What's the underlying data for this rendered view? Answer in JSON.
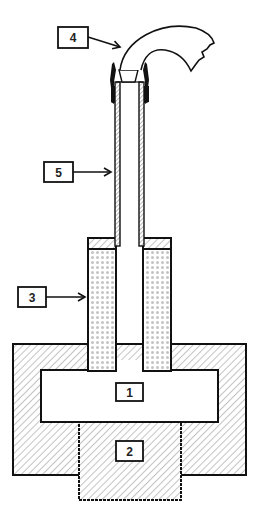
{
  "diagram": {
    "type": "cross-section schematic",
    "colors": {
      "stroke": "#111111",
      "hatch": "#9a9a9a",
      "dots": "#c4c4c4",
      "background": "#ffffff"
    },
    "labels": [
      {
        "id": "1",
        "text": "1",
        "target": "central-chamber"
      },
      {
        "id": "2",
        "text": "2",
        "target": "lower-block"
      },
      {
        "id": "3",
        "text": "3",
        "target": "dotted-column"
      },
      {
        "id": "4",
        "text": "4",
        "target": "curved-hose"
      },
      {
        "id": "5",
        "text": "5",
        "target": "thin-tube"
      }
    ]
  }
}
